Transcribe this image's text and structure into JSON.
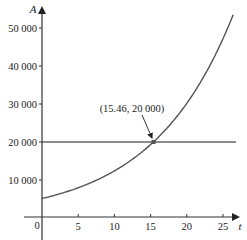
{
  "chart_data": {
    "type": "line",
    "title": "",
    "xlabel": "t",
    "ylabel": "A",
    "xlim": [
      -2.5,
      27.5
    ],
    "ylim": [
      -5000,
      55000
    ],
    "x_ticks": [
      5,
      10,
      15,
      20,
      25
    ],
    "y_ticks": [
      10000,
      20000,
      30000,
      40000,
      50000
    ],
    "x_tick_labels": [
      "5",
      "10",
      "15",
      "20",
      "25"
    ],
    "y_tick_labels": [
      "10 000",
      "20 000",
      "30 000",
      "40 000",
      "50 000"
    ],
    "origin_label": "0",
    "grid": false,
    "legend": null,
    "series": [
      {
        "name": "A(t) = 5000·e^(0.0897t)",
        "x": [
          0,
          2.5,
          5,
          7.5,
          10,
          12.5,
          15,
          15.46,
          17.5,
          20,
          22.5,
          25,
          26.4
        ],
        "values": [
          5000,
          6255,
          7823,
          9787,
          12244,
          15317,
          19162,
          20000,
          23972,
          29991,
          37519,
          46938,
          53200
        ]
      },
      {
        "name": "A = 20000",
        "x": [
          0,
          27
        ],
        "values": [
          20000,
          20000
        ]
      }
    ],
    "annotations": [
      {
        "text": "(15.46, 20000)",
        "x": 15.46,
        "y": 20000,
        "type": "arrow-label"
      }
    ]
  },
  "labels": {
    "y_axis": "A",
    "x_axis": "t",
    "origin": "0",
    "y_ticks": [
      "10 000",
      "20 000",
      "30 000",
      "40 000",
      "50 000"
    ],
    "x_ticks": [
      "5",
      "10",
      "15",
      "20",
      "25"
    ],
    "intersection": "(15.46, 20 000)"
  },
  "colors": {
    "curve": "#555555",
    "axis": "#333333",
    "hline": "#666666",
    "point": "#555555"
  }
}
